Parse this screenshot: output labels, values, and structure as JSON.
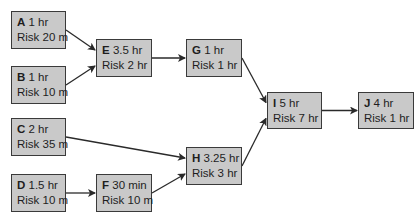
{
  "diagram": {
    "type": "network-diagram",
    "colors": {
      "node_fill": "#c9c9c9",
      "node_border": "#3a3a3a",
      "edge": "#2a2a2a",
      "background": "#ffffff"
    },
    "nodes": [
      {
        "id": "A",
        "duration": "1 hr",
        "risk": "Risk 20 m",
        "x": 11,
        "y": 11,
        "w": 55,
        "h": 38
      },
      {
        "id": "B",
        "duration": "1 hr",
        "risk": "Risk 10 m",
        "x": 11,
        "y": 66,
        "w": 55,
        "h": 38
      },
      {
        "id": "C",
        "duration": "2 hr",
        "risk": "Risk 35 m",
        "x": 11,
        "y": 118,
        "w": 55,
        "h": 38
      },
      {
        "id": "D",
        "duration": "1.5 hr",
        "risk": "Risk 10 m",
        "x": 11,
        "y": 174,
        "w": 55,
        "h": 38
      },
      {
        "id": "E",
        "duration": "3.5 hr",
        "risk": "Risk 2 hr",
        "x": 96,
        "y": 39,
        "w": 56,
        "h": 38
      },
      {
        "id": "F",
        "duration": "30 min",
        "risk": "Risk 10 m",
        "x": 96,
        "y": 174,
        "w": 56,
        "h": 38
      },
      {
        "id": "G",
        "duration": "1 hr",
        "risk": "Risk 1 hr",
        "x": 186,
        "y": 39,
        "w": 56,
        "h": 38
      },
      {
        "id": "H",
        "duration": "3.25 hr",
        "risk": "Risk 3 hr",
        "x": 186,
        "y": 147,
        "w": 56,
        "h": 38
      },
      {
        "id": "I",
        "duration": "5 hr",
        "risk": "Risk 7 hr",
        "x": 267,
        "y": 92,
        "w": 55,
        "h": 37
      },
      {
        "id": "J",
        "duration": "4 hr",
        "risk": "Risk 1 hr",
        "x": 358,
        "y": 92,
        "w": 56,
        "h": 37
      }
    ],
    "edges": [
      {
        "from": "A",
        "to": "E"
      },
      {
        "from": "B",
        "to": "E"
      },
      {
        "from": "E",
        "to": "G"
      },
      {
        "from": "G",
        "to": "I"
      },
      {
        "from": "C",
        "to": "H"
      },
      {
        "from": "D",
        "to": "F"
      },
      {
        "from": "F",
        "to": "H"
      },
      {
        "from": "H",
        "to": "I"
      },
      {
        "from": "I",
        "to": "J"
      }
    ]
  }
}
